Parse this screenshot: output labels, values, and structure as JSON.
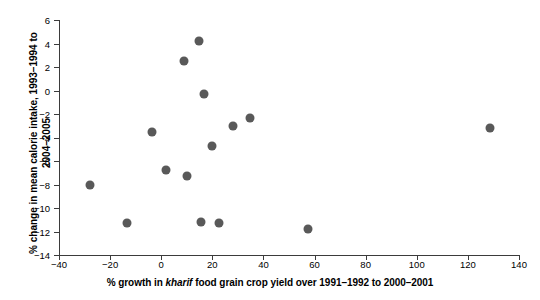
{
  "chart_data": {
    "type": "scatter",
    "title": "",
    "xlabel_parts": {
      "pre": "% growth in ",
      "italic": "kharif",
      "post": " food grain crop yield over 1991–1992 to 2000–2001"
    },
    "xlabel": "% growth in kharif food grain crop yield over 1991–1992 to 2000–2001",
    "ylabel_line1": "% change in mean calorie intake, 1993–1994 to",
    "ylabel_line2": "2004–2005",
    "ylabel": "% change in mean calorie intake, 1993–1994 to 2004–2005",
    "xlim": [
      -40,
      140
    ],
    "ylim": [
      -14,
      6
    ],
    "xticks": [
      -40,
      -20,
      0,
      20,
      40,
      60,
      80,
      100,
      120,
      140
    ],
    "yticks": [
      6,
      4,
      2,
      0,
      -2,
      -4,
      -6,
      -8,
      -10,
      -12,
      -14
    ],
    "xtick_labels": [
      "−40",
      "−20",
      "0",
      "20",
      "40",
      "60",
      "80",
      "100",
      "120",
      "140"
    ],
    "ytick_labels": [
      "6",
      "4",
      "2",
      "0",
      "−2",
      "−4",
      "−6",
      "−8",
      "−10",
      "−12",
      "−14"
    ],
    "grid": false,
    "legend": null,
    "marker_color": "#595959",
    "axis_color": "#3b3b3b",
    "points": [
      {
        "x": -27.9,
        "y": -8.0
      },
      {
        "x": -13.5,
        "y": -11.3
      },
      {
        "x": -3.7,
        "y": -3.5
      },
      {
        "x": 2.0,
        "y": -6.8
      },
      {
        "x": 8.8,
        "y": 2.5
      },
      {
        "x": 10.0,
        "y": -7.3
      },
      {
        "x": 14.7,
        "y": 4.2
      },
      {
        "x": 15.5,
        "y": -11.2
      },
      {
        "x": 16.7,
        "y": -0.3
      },
      {
        "x": 19.9,
        "y": -4.7
      },
      {
        "x": 27.9,
        "y": -3.0
      },
      {
        "x": 34.7,
        "y": -2.3
      },
      {
        "x": 22.5,
        "y": -11.3
      },
      {
        "x": 57.5,
        "y": -11.8
      },
      {
        "x": 128.7,
        "y": -3.2
      }
    ]
  }
}
